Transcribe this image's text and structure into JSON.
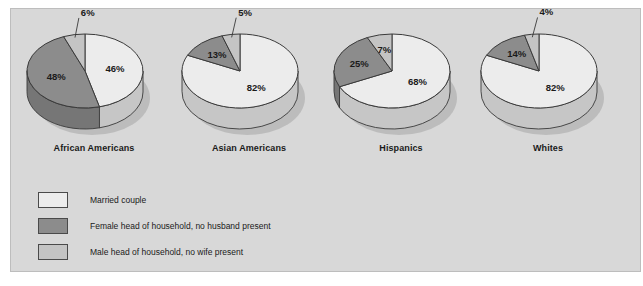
{
  "chart_data": {
    "type": "pie",
    "title": "",
    "legend_position": "bottom-left",
    "colors": {
      "married": "#ececec",
      "female_head": "#8c8c8c",
      "male_head": "#c4c4c4",
      "outline": "#3a3a3a",
      "panel_bg": "#d8d8d8",
      "panel_border": "#bdbdbd",
      "text": "#1a1a1a"
    },
    "legend": [
      {
        "key": "married",
        "label": "Married couple",
        "color": "#ececec"
      },
      {
        "key": "female_head",
        "label": "Female head of household, no husband present",
        "color": "#8c8c8c"
      },
      {
        "key": "male_head",
        "label": "Male head of household, no wife present",
        "color": "#c4c4c4"
      }
    ],
    "categories": [
      "African Americans",
      "Asian Americans",
      "Hispanics",
      "Whites"
    ],
    "series": [
      {
        "name": "Married couple",
        "values": [
          46,
          82,
          68,
          82
        ]
      },
      {
        "name": "Female head of household, no husband present",
        "values": [
          48,
          13,
          25,
          14
        ]
      },
      {
        "name": "Male head of household, no wife present",
        "values": [
          6,
          5,
          7,
          4
        ]
      }
    ],
    "pies": [
      {
        "label": "African Americans",
        "slices": [
          {
            "key": "married",
            "value": 46,
            "label": "46%"
          },
          {
            "key": "female_head",
            "value": 48,
            "label": "48%"
          },
          {
            "key": "male_head",
            "value": 6,
            "label": "6%"
          }
        ]
      },
      {
        "label": "Asian Americans",
        "slices": [
          {
            "key": "married",
            "value": 82,
            "label": "82%"
          },
          {
            "key": "female_head",
            "value": 13,
            "label": "13%"
          },
          {
            "key": "male_head",
            "value": 5,
            "label": "5%"
          }
        ]
      },
      {
        "label": "Hispanics",
        "slices": [
          {
            "key": "married",
            "value": 68,
            "label": "68%"
          },
          {
            "key": "female_head",
            "value": 25,
            "label": "25%"
          },
          {
            "key": "male_head",
            "value": 7,
            "label": "7%"
          }
        ]
      },
      {
        "label": "Whites",
        "slices": [
          {
            "key": "married",
            "value": 82,
            "label": "82%"
          },
          {
            "key": "female_head",
            "value": 14,
            "label": "14%"
          },
          {
            "key": "male_head",
            "value": 4,
            "label": "4%"
          }
        ]
      }
    ]
  }
}
